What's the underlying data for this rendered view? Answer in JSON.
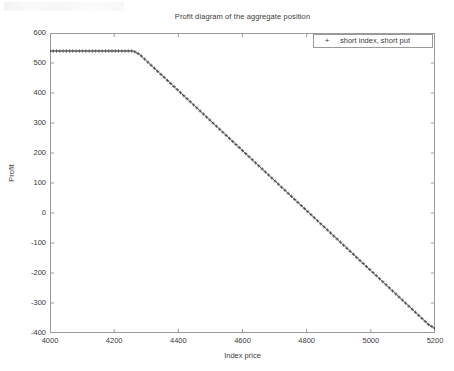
{
  "chart_data": {
    "type": "line",
    "title": "Profit diagram of the aggregate position",
    "xlabel": "Index price",
    "ylabel": "Profit",
    "xlim": [
      4000,
      5200
    ],
    "ylim": [
      -400,
      600
    ],
    "xticks": [
      4000,
      4200,
      4400,
      4600,
      4800,
      5000,
      5200
    ],
    "yticks": [
      600,
      500,
      400,
      300,
      200,
      100,
      0,
      -100,
      -200,
      -300,
      -400
    ],
    "grid": false,
    "legend_position": "upper-right",
    "marker": "+",
    "series": [
      {
        "name": "short index, short put",
        "marker": "+",
        "color": "#3a3a3a",
        "x": [
          4000,
          4020,
          4040,
          4060,
          4080,
          4100,
          4120,
          4140,
          4160,
          4180,
          4200,
          4220,
          4240,
          4260,
          4280,
          4300,
          4320,
          4340,
          4360,
          4380,
          4400,
          4420,
          4440,
          4460,
          4480,
          4500,
          4520,
          4540,
          4560,
          4580,
          4600,
          4620,
          4640,
          4660,
          4680,
          4700,
          4720,
          4740,
          4760,
          4780,
          4800,
          4820,
          4840,
          4860,
          4880,
          4900,
          4920,
          4940,
          4960,
          4980,
          5000,
          5020,
          5040,
          5060,
          5080,
          5100,
          5120,
          5140,
          5160,
          5180,
          5200
        ],
        "y": [
          540,
          540,
          540,
          540,
          540,
          540,
          540,
          540,
          540,
          540,
          540,
          540,
          540,
          540,
          528,
          508,
          488,
          468,
          448,
          428,
          408,
          388,
          368,
          348,
          328,
          308,
          288,
          268,
          248,
          228,
          208,
          188,
          168,
          148,
          128,
          108,
          88,
          68,
          48,
          28,
          8,
          -12,
          -32,
          -52,
          -72,
          -92,
          -112,
          -132,
          -152,
          -172,
          -192,
          -212,
          -232,
          -252,
          -272,
          -292,
          -312,
          -332,
          -352,
          -372,
          -385
        ]
      }
    ],
    "annotations": {
      "plateau_value": 540,
      "kink_x": 4270,
      "zero_crossing_x": 4808,
      "end_value": -385
    }
  },
  "legend": {
    "marker_glyph": "+",
    "entries": [
      {
        "label": "short index, short put"
      }
    ]
  },
  "axes": {
    "x_tick_labels": [
      "4000",
      "4200",
      "4400",
      "4600",
      "4800",
      "5000",
      "5200"
    ],
    "y_tick_labels": [
      "600",
      "500",
      "400",
      "300",
      "200",
      "100",
      "0",
      "-100",
      "-200",
      "-300",
      "-400"
    ]
  }
}
